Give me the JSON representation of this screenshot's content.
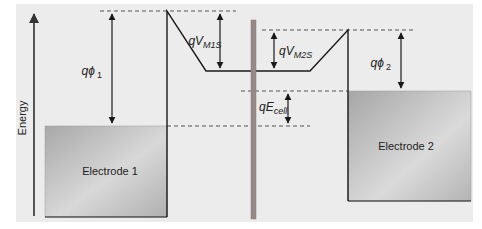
{
  "diagram": {
    "type": "energy-band-diagram",
    "axis_label": "Energy",
    "electrodes": [
      {
        "label": "Electrode 1"
      },
      {
        "label": "Electrode 2"
      }
    ],
    "annotations": {
      "phi1": {
        "prefix": "q",
        "symbol": "ϕ",
        "sub": "1"
      },
      "vm1s": {
        "prefix": "qV",
        "sub": "M1S"
      },
      "vm2s": {
        "prefix": "qV",
        "sub": "M2S"
      },
      "phi2": {
        "prefix": "q",
        "symbol": "ϕ",
        "sub": "2"
      },
      "ecell": {
        "prefix": "qE",
        "sub": "cell"
      }
    },
    "colors": {
      "background": "#ececec",
      "electrode_fill_light": "#d4d4d4",
      "electrode_fill_dark": "#a9a9a9",
      "membrane": "#9a8886",
      "line": "#1a1a1a",
      "dash": "#555555"
    }
  }
}
